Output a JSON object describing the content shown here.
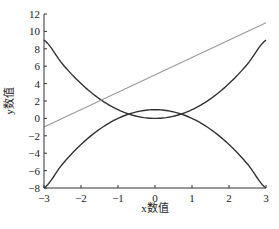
{
  "chart_data": {
    "type": "line",
    "title": "",
    "xlabel": "x数值",
    "ylabel": "y数值",
    "xlim": [
      -3,
      3
    ],
    "ylim": [
      -8,
      12
    ],
    "xticks": [
      -3,
      -2,
      -1,
      0,
      1,
      2,
      3
    ],
    "yticks": [
      -8,
      -6,
      -4,
      -2,
      0,
      2,
      4,
      6,
      8,
      10,
      12
    ],
    "grid": false,
    "legend": null,
    "series": [
      {
        "name": "y = x^2",
        "color": "#333333",
        "width": 1.4,
        "x": [
          -3,
          -2.5,
          -2,
          -1.5,
          -1,
          -0.5,
          0,
          0.5,
          1,
          1.5,
          2,
          2.5,
          3
        ],
        "y": [
          9,
          6.25,
          4,
          2.25,
          1,
          0.25,
          0,
          0.25,
          1,
          2.25,
          4,
          6.25,
          9
        ]
      },
      {
        "name": "y = 1 - x^2",
        "color": "#333333",
        "width": 1.4,
        "x": [
          -3,
          -2.5,
          -2,
          -1.5,
          -1,
          -0.5,
          0,
          0.5,
          1,
          1.5,
          2,
          2.5,
          3
        ],
        "y": [
          -8,
          -5.25,
          -3,
          -1.25,
          0,
          0.75,
          1,
          0.75,
          0,
          -1.25,
          -3,
          -5.25,
          -8
        ]
      },
      {
        "name": "y = 2x + 5",
        "color": "#999999",
        "width": 1.1,
        "x": [
          -3,
          3
        ],
        "y": [
          -1,
          11
        ]
      }
    ]
  }
}
